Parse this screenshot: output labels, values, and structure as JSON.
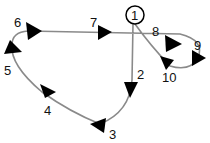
{
  "diagram": {
    "type": "numbered-path-route",
    "start_node": {
      "label": "1",
      "shape": "circle"
    },
    "points": [
      {
        "label": "1",
        "x": 135,
        "y": 15
      },
      {
        "label": "2",
        "x": 141,
        "y": 75
      },
      {
        "label": "3",
        "x": 114,
        "y": 133
      },
      {
        "label": "4",
        "x": 47,
        "y": 112
      },
      {
        "label": "5",
        "x": 8,
        "y": 72
      },
      {
        "label": "6",
        "x": 16,
        "y": 24
      },
      {
        "label": "7",
        "x": 94,
        "y": 24
      },
      {
        "label": "8",
        "x": 158,
        "y": 35
      },
      {
        "label": "9",
        "x": 198,
        "y": 47
      },
      {
        "label": "10",
        "x": 174,
        "y": 82
      }
    ],
    "arrow_direction": "sequence 1 → 2 → 3 → 4 → 5 → 6 → 7 → 8 → 9 → 10 → 1",
    "colors": {
      "line": "#8a8a8a",
      "arrow": "#000000",
      "text": "#111111",
      "background": "#ffffff"
    }
  }
}
